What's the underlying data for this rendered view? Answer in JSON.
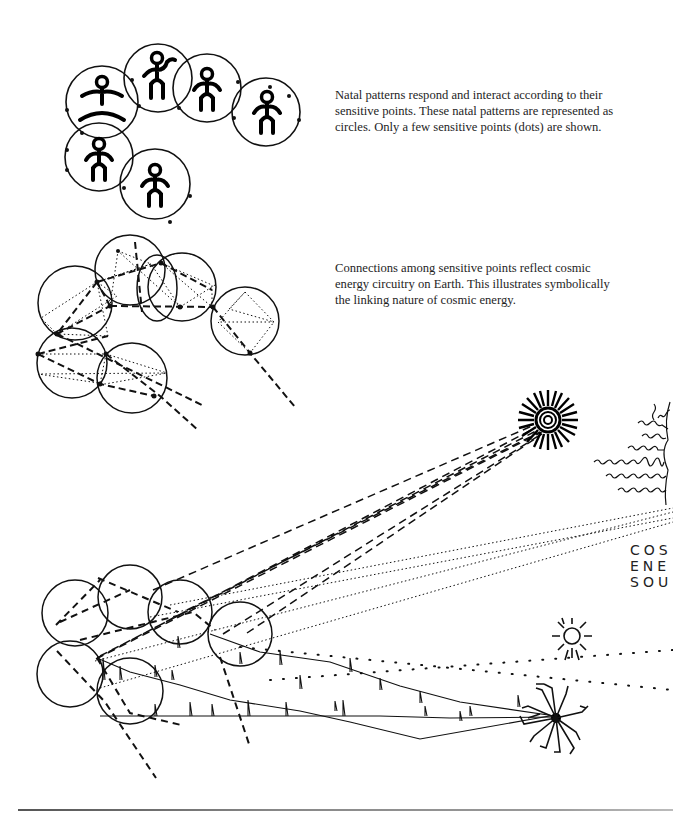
{
  "figure": {
    "panels": [
      {
        "id": "natal-patterns",
        "caption": "Natal patterns respond and interact according to their sensitive points. These natal patterns are represented as circles. Only a few sensitive points (dots) are shown.",
        "circle_count": 6
      },
      {
        "id": "connections",
        "caption": "Connections among sensitive points reflect cosmic energy circuitry on Earth. This illustrates symbolically the linking nature of cosmic energy.",
        "circle_count": 6
      },
      {
        "id": "cosmic-energy-sources",
        "label_lines": [
          "COS",
          "ENE",
          "SOU"
        ],
        "sources": [
          "radiating-sun",
          "wavy-sun",
          "small-sun",
          "starburst"
        ]
      }
    ]
  }
}
